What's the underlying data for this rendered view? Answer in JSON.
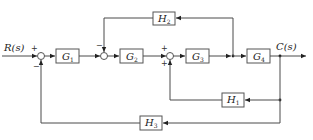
{
  "diagram": {
    "type": "control-system block diagram",
    "input": {
      "label": "R(s)"
    },
    "output": {
      "label": "C(s)"
    },
    "blocks": {
      "G1": {
        "base": "G",
        "sub": "1"
      },
      "G2": {
        "base": "G",
        "sub": "2"
      },
      "G3": {
        "base": "G",
        "sub": "3"
      },
      "G4": {
        "base": "G",
        "sub": "4"
      },
      "H1": {
        "base": "H",
        "sub": "1"
      },
      "H2": {
        "base": "H",
        "sub": "2"
      },
      "H3": {
        "base": "H",
        "sub": "3"
      }
    },
    "summing_junctions": {
      "s1": {
        "signs": [
          "+",
          "−"
        ],
        "note": "R(s) +, H3 feedback −"
      },
      "s2": {
        "signs": [
          "−"
        ],
        "note": "H2 feedback −"
      },
      "s3": {
        "signs": [
          "+",
          "+"
        ],
        "note": "G2 output +, H1 feedback +"
      }
    },
    "signs": {
      "s1_top": "+",
      "s1_bottom": "−",
      "s2_top": "−",
      "s3_top": "+",
      "s3_bottom": "+"
    },
    "connections": [
      "R(s) -> s1(+)",
      "s1 -> G1",
      "G1 -> s2",
      "s2 -> G2",
      "G2 -> s3(+)",
      "s3 -> G3",
      "G3 -> node A",
      "node A -> G4",
      "G4 -> C(s)",
      "node A -> H2 -> s2(−)",
      "C(s) -> H1 -> s3(+)",
      "C(s) -> H3 -> s1(−)"
    ]
  }
}
